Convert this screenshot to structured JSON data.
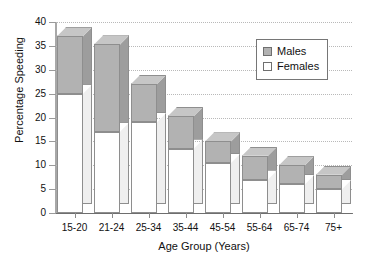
{
  "chart_data": {
    "type": "bar",
    "title": "",
    "xlabel": "Age Group (Years)",
    "ylabel": "Percentage Speeding",
    "categories": [
      "15-20",
      "21-24",
      "25-34",
      "35-44",
      "45-54",
      "55-64",
      "65-74",
      "75+"
    ],
    "series": [
      {
        "name": "Females",
        "values": [
          25,
          17,
          19,
          13.5,
          10.5,
          7,
          6,
          5
        ]
      },
      {
        "name": "Males",
        "values": [
          12,
          18.3,
          8,
          6.8,
          4.5,
          5,
          4,
          3
        ]
      }
    ],
    "totals": [
      37,
      35.3,
      27,
      20.3,
      15,
      12,
      10,
      8
    ],
    "stacked": true,
    "ylim": [
      0,
      40
    ],
    "yticks": [
      0,
      5,
      10,
      15,
      20,
      25,
      30,
      35,
      40
    ],
    "ytick_labels": [
      "0",
      "5",
      "10",
      "15",
      "20",
      "25",
      "30",
      "35",
      "40"
    ],
    "grid": true,
    "legend_position": "upper right",
    "legend": [
      "Males",
      "Females"
    ],
    "colors": {
      "males": "#b2b2b2",
      "females": "#ffffff",
      "outline": "#8e8e8e",
      "grid": "#b9b9b9"
    }
  }
}
